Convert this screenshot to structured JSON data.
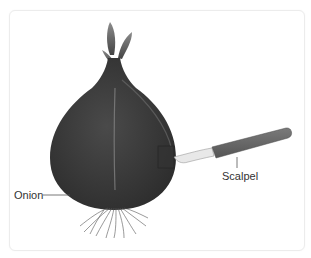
{
  "figure": {
    "labels": {
      "onion": "Onion",
      "scalpel": "Scalpel"
    },
    "colors": {
      "onion_body": "#3a3a3a",
      "onion_highlight": "#8a8a8a",
      "scalpel_handle": "#6a6a6a",
      "scalpel_blade": "#e8e8e8",
      "label_text": "#333333",
      "leader_line": "#555555",
      "card_border": "#ececec"
    }
  }
}
